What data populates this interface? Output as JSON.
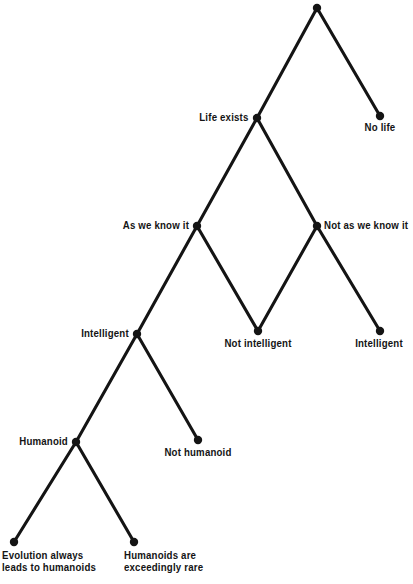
{
  "figure": {
    "type": "decision-tree-diagram",
    "background_color": "#ffffff",
    "line_color": "#141414",
    "node_color": "#141414",
    "width": 408,
    "height": 584
  },
  "nodes": [
    {
      "id": "root",
      "label": "",
      "x": 317,
      "y": 8,
      "label_x": 317,
      "label_y": 8,
      "label_placement": "none",
      "is_leaf": false
    },
    {
      "id": "life-exists",
      "label": "Life exists",
      "x": 257,
      "y": 118,
      "label_x": 249,
      "label_y": 112,
      "label_placement": "left",
      "is_leaf": false
    },
    {
      "id": "no-life",
      "label": "No life",
      "x": 380,
      "y": 116,
      "label_x": 380,
      "label_y": 122,
      "label_placement": "below",
      "is_leaf": true
    },
    {
      "id": "as-we-know-it",
      "label": "As we know it",
      "x": 197,
      "y": 226,
      "label_x": 189,
      "label_y": 220,
      "label_placement": "left",
      "is_leaf": false
    },
    {
      "id": "not-as-we-know-it",
      "label": "Not as we know it",
      "x": 317,
      "y": 226,
      "label_x": 324,
      "label_y": 220,
      "label_placement": "right",
      "is_leaf": false
    },
    {
      "id": "intelligent-left",
      "label": "Intelligent",
      "x": 137,
      "y": 334,
      "label_x": 129,
      "label_y": 328,
      "label_placement": "left",
      "is_leaf": false
    },
    {
      "id": "not-intelligent",
      "label": "Not intelligent",
      "x": 258,
      "y": 331,
      "label_x": 258,
      "label_y": 338,
      "label_placement": "below",
      "is_leaf": true
    },
    {
      "id": "intelligent-right",
      "label": "Intelligent",
      "x": 380,
      "y": 331,
      "label_x": 379,
      "label_y": 338,
      "label_placement": "below",
      "is_leaf": true
    },
    {
      "id": "humanoid",
      "label": "Humanoid",
      "x": 76,
      "y": 442,
      "label_x": 68,
      "label_y": 436,
      "label_placement": "left",
      "is_leaf": false
    },
    {
      "id": "not-humanoid",
      "label": "Not humanoid",
      "x": 198,
      "y": 440,
      "label_x": 198,
      "label_y": 447,
      "label_placement": "below",
      "is_leaf": true
    },
    {
      "id": "evolution-always-leads-to-humanoids",
      "label": "Evolution always\nleads to humanoids",
      "x": 14,
      "y": 542,
      "label_x": 2,
      "label_y": 550,
      "label_placement": "below-left",
      "is_leaf": true
    },
    {
      "id": "humanoids-are-exceedingly-rare",
      "label": "Humanoids are\nexceedingly rare",
      "x": 134,
      "y": 542,
      "label_x": 124,
      "label_y": 550,
      "label_placement": "below-left",
      "is_leaf": true
    }
  ],
  "edges": [
    {
      "id": "root-to-life-exists",
      "from": "root",
      "to": "life-exists"
    },
    {
      "id": "root-to-no-life",
      "from": "root",
      "to": "no-life"
    },
    {
      "id": "life-exists-to-as-we-know-it",
      "from": "life-exists",
      "to": "as-we-know-it"
    },
    {
      "id": "life-exists-to-not-as-we-know-it",
      "from": "life-exists",
      "to": "not-as-we-know-it"
    },
    {
      "id": "as-we-know-it-to-intelligent-left",
      "from": "as-we-know-it",
      "to": "intelligent-left"
    },
    {
      "id": "as-we-know-it-to-not-intelligent",
      "from": "as-we-know-it",
      "to": "not-intelligent"
    },
    {
      "id": "not-as-we-know-it-to-not-intelligent",
      "from": "not-as-we-know-it",
      "to": "not-intelligent"
    },
    {
      "id": "not-as-we-know-it-to-intelligent-right",
      "from": "not-as-we-know-it",
      "to": "intelligent-right"
    },
    {
      "id": "intelligent-left-to-humanoid",
      "from": "intelligent-left",
      "to": "humanoid"
    },
    {
      "id": "intelligent-left-to-not-humanoid",
      "from": "intelligent-left",
      "to": "not-humanoid"
    },
    {
      "id": "humanoid-to-evolution-always",
      "from": "humanoid",
      "to": "evolution-always-leads-to-humanoids"
    },
    {
      "id": "humanoid-to-humanoids-rare",
      "from": "humanoid",
      "to": "humanoids-are-exceedingly-rare"
    }
  ],
  "style": {
    "edge_width": 3.1,
    "node_radius": 4.2
  }
}
